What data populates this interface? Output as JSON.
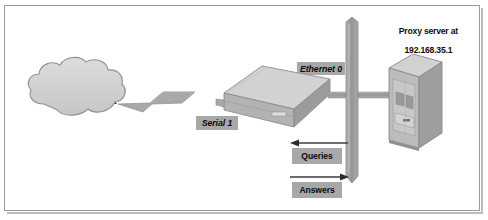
{
  "diagram": {
    "title_text": "",
    "frame": {
      "border_color": "#9a9a9a",
      "background": "#ffffff"
    },
    "nodes": {
      "cloud": {
        "label": "To Internet",
        "shape": "cloud-icon",
        "fill": "#d2d2d2",
        "stroke": "#8e8e8e"
      },
      "router": {
        "label": "Router",
        "shape": "router-icon",
        "top_fill": "#cfcfcf",
        "front_fill": "#b0b0b0",
        "side_fill": "#9c9c9c"
      },
      "server": {
        "label_line1": "Proxy server at",
        "label_line2": "192.168.35.1",
        "shape": "server-tower-icon",
        "front_fill": "#b6b6b6",
        "top_fill": "#d0d0d0",
        "side_fill": "#9b9b9b"
      },
      "backbone": {
        "shape": "network-backbone-icon",
        "fill": "#9e9e9e"
      }
    },
    "interface_tags": [
      {
        "id": "ethernet0",
        "label": "Ethernet 0",
        "style": "bold-italic",
        "box_fill": "#a8a8a8"
      },
      {
        "id": "serial1",
        "label": "Serial 1",
        "style": "bold-italic",
        "box_fill": "#a8a8a8"
      }
    ],
    "flow_tags": [
      {
        "id": "queries",
        "label": "Queries",
        "direction": "left",
        "box_fill": "#a8a8a8",
        "arrow_color": "#3c3c3c"
      },
      {
        "id": "answers",
        "label": "Answers",
        "direction": "right",
        "box_fill": "#a8a8a8",
        "arrow_color": "#3c3c3c"
      }
    ],
    "links": [
      {
        "id": "cloud-to-router",
        "style": "lightning-connector",
        "fill": "#a6a6a6"
      },
      {
        "id": "router-to-backbone",
        "style": "straight-cable",
        "fill": "#a6a6a6"
      },
      {
        "id": "backbone-to-server",
        "style": "straight-cable",
        "fill": "#a6a6a6"
      }
    ]
  }
}
